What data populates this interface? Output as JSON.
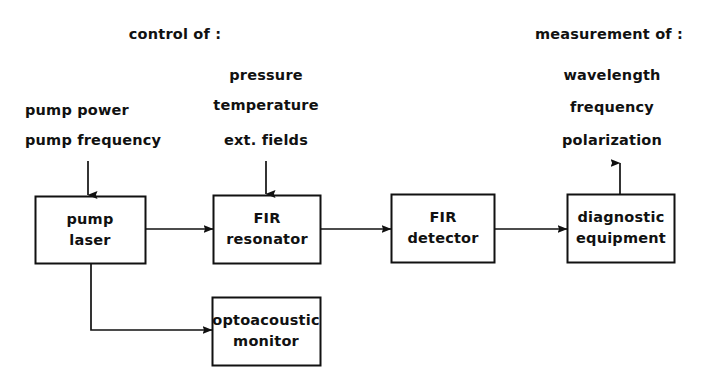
{
  "diagram": {
    "background_color": "#ffffff",
    "line_color": "#111111",
    "text_color": "#111111",
    "groups": {
      "control": {
        "heading": "control  of :",
        "pump_params": [
          "pump  power",
          "pump  frequency"
        ],
        "resonator_params": [
          "pressure",
          "temperature",
          "ext.  fields"
        ]
      },
      "measurement": {
        "heading": "measurement  of :",
        "params": [
          "wavelength",
          "frequency",
          "polarization"
        ]
      }
    },
    "boxes": {
      "pump_laser": {
        "line1": "pump",
        "line2": "laser"
      },
      "fir_resonator": {
        "line1": "FIR",
        "line2": "resonator"
      },
      "fir_detector": {
        "line1": "FIR",
        "line2": "detector"
      },
      "diagnostic_equipment": {
        "line1": "diagnostic",
        "line2": "equipment"
      },
      "optoacoustic_monitor": {
        "line1": "optoacoustic",
        "line2": "monitor"
      }
    },
    "connections": [
      {
        "from": "pump-power-frequency-labels",
        "to": "pump_laser",
        "direction": "down"
      },
      {
        "from": "pump_laser",
        "to": "fir_resonator",
        "direction": "right"
      },
      {
        "from": "pressure-temperature-fields-labels",
        "to": "fir_resonator",
        "direction": "down"
      },
      {
        "from": "fir_resonator",
        "to": "fir_detector",
        "direction": "right"
      },
      {
        "from": "fir_detector",
        "to": "diagnostic_equipment",
        "direction": "right"
      },
      {
        "from": "diagnostic_equipment",
        "to": "measurement-labels",
        "direction": "up"
      },
      {
        "from": "pump_laser",
        "to": "optoacoustic_monitor",
        "direction": "down-right"
      }
    ]
  }
}
